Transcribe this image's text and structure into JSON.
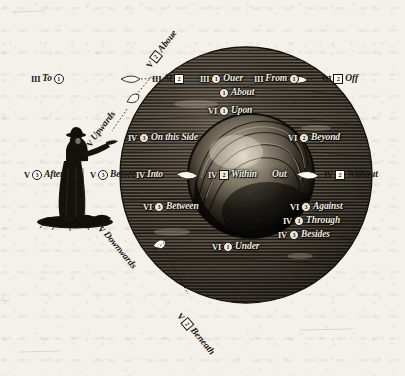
{
  "plate": {
    "title": "Praepositiones",
    "description": "Engraved plate showing a man pointing at a globe, with prepositions arranged in position around it",
    "ink_color": "#1a1713",
    "paper_color": "#f4f1ea",
    "globe_color": "#2b2620"
  },
  "figure": {
    "name": "standing-man-pointing"
  },
  "labels": [
    {
      "id": "to",
      "roman": "III",
      "num": "1",
      "num_style": "circle",
      "word": "To",
      "order": "roman-num-word",
      "placement": "outer-upper-left"
    },
    {
      "id": "above",
      "roman": "V",
      "num": "2",
      "num_style": "square",
      "word": "Aboue",
      "order": "roman-num-word",
      "placement": "outer-upper-diagonal"
    },
    {
      "id": "at",
      "roman": "III",
      "num": "2",
      "num_style": "square",
      "word": "At",
      "order": "roman-word-num",
      "placement": "globe-upper-left-edge"
    },
    {
      "id": "over",
      "roman": "III",
      "num": "1",
      "num_style": "circle",
      "word": "Ouer",
      "order": "roman-num-word",
      "placement": "globe-top"
    },
    {
      "id": "from",
      "roman": "III",
      "num": "1",
      "num_style": "circle",
      "word": "From",
      "order": "roman-word-num",
      "placement": "globe-upper-right-edge"
    },
    {
      "id": "off",
      "roman": "III",
      "num": "2",
      "num_style": "square",
      "word": "Off",
      "order": "roman-num-word",
      "placement": "outer-upper-right"
    },
    {
      "id": "about",
      "roman": "",
      "num": "1",
      "num_style": "circle",
      "word": "About",
      "order": "roman-num-word",
      "placement": "globe-top-inner"
    },
    {
      "id": "upon",
      "roman": "VI",
      "num": "1",
      "num_style": "circle",
      "word": "Upon",
      "order": "roman-num-word",
      "placement": "globe-upper-middle"
    },
    {
      "id": "upwards",
      "roman": "V",
      "num": "1",
      "num_style": "circle",
      "word": "Upwards",
      "order": "roman-word-num",
      "placement": "diagonal-upper-left"
    },
    {
      "id": "on-this-side",
      "roman": "IV",
      "num": "3",
      "num_style": "circle",
      "word": "On this Side",
      "order": "roman-num-word",
      "placement": "globe-left-upper"
    },
    {
      "id": "beyond",
      "roman": "VI",
      "num": "2",
      "num_style": "circle",
      "word": "Beyond",
      "order": "roman-num-word",
      "placement": "globe-right-upper"
    },
    {
      "id": "after",
      "roman": "V",
      "num": "3",
      "num_style": "circle",
      "word": "After",
      "order": "roman-num-word",
      "placement": "far-left"
    },
    {
      "id": "before",
      "roman": "V",
      "num": "3",
      "num_style": "circle",
      "word": "Before",
      "order": "roman-num-word",
      "placement": "left-of-globe"
    },
    {
      "id": "into",
      "roman": "IV",
      "num": "1",
      "num_style": "circle",
      "word": "Into",
      "order": "roman-num-word",
      "placement": "globe-left-edge"
    },
    {
      "id": "within",
      "roman": "IV",
      "num": "2",
      "num_style": "square",
      "word": "Within",
      "order": "roman-num-word",
      "placement": "globe-centre"
    },
    {
      "id": "out",
      "roman": "",
      "num": "1",
      "num_style": "circle",
      "word": "Out",
      "order": "word-num",
      "placement": "globe-centre-right"
    },
    {
      "id": "without",
      "roman": "IV",
      "num": "2",
      "num_style": "square",
      "word": "Without",
      "order": "roman-num-word",
      "placement": "far-right"
    },
    {
      "id": "between",
      "roman": "VI",
      "num": "3",
      "num_style": "circle",
      "word": "Between",
      "order": "roman-num-word",
      "placement": "globe-left-lower"
    },
    {
      "id": "against",
      "roman": "VI",
      "num": "3",
      "num_style": "circle",
      "word": "Against",
      "order": "roman-num-word",
      "placement": "globe-right-lower"
    },
    {
      "id": "through",
      "roman": "IV",
      "num": "1",
      "num_style": "circle",
      "word": "Through",
      "order": "roman-num-word",
      "placement": "globe-right-lower-2"
    },
    {
      "id": "besides",
      "roman": "IV",
      "num": "3",
      "num_style": "circle",
      "word": "Besides",
      "order": "roman-num-word",
      "placement": "globe-right-lower-3"
    },
    {
      "id": "under",
      "roman": "VI",
      "num": "1",
      "num_style": "circle",
      "word": "Under",
      "order": "roman-num-word",
      "placement": "globe-bottom"
    },
    {
      "id": "downwards",
      "roman": "V",
      "num": "1",
      "num_style": "circle",
      "word": "Downwards",
      "order": "roman-word-num",
      "placement": "diagonal-lower-left"
    },
    {
      "id": "beneath",
      "roman": "V",
      "num": "2",
      "num_style": "square",
      "word": "Beneath",
      "order": "roman-num-word",
      "placement": "outer-lower-diagonal"
    }
  ]
}
